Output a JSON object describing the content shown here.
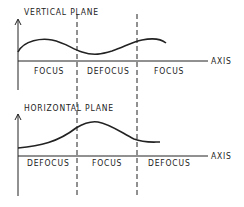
{
  "diagram": {
    "panels": [
      {
        "title": "VERTICAL PLANE",
        "axis_label": "AXIS",
        "regions": [
          "FOCUS",
          "DEFOCUS",
          "FOCUS"
        ]
      },
      {
        "title": "HORIZONTAL PLANE",
        "axis_label": "AXIS",
        "regions": [
          "DEFOCUS",
          "FOCUS",
          "DEFOCUS"
        ]
      }
    ],
    "colors": {
      "line": "#222222",
      "background": "#ffffff"
    }
  }
}
